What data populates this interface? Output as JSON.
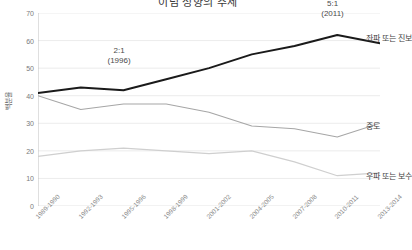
{
  "chart_data": {
    "type": "line",
    "title": "이념 성향의 추세",
    "xlabel": "",
    "ylabel": "백분율",
    "ylim": [
      0,
      70
    ],
    "ytick_step": 10,
    "yticks": [
      "70",
      "60",
      "50",
      "40",
      "30",
      "20",
      "10",
      "0"
    ],
    "grid": true,
    "legend_position": "right-of-line-ends",
    "categories": [
      "1989-1990",
      "1992-1993",
      "1995-1996",
      "1998-1999",
      "2001-2002",
      "2004-2005",
      "2007-2008",
      "2010-2011",
      "2013-2014"
    ],
    "series": [
      {
        "name": "좌파 또는 진보",
        "color": "#1a1a1a",
        "values": [
          41,
          43,
          42,
          46,
          50,
          55,
          58,
          62,
          59
        ]
      },
      {
        "name": "중도",
        "color": "#a6a6a6",
        "values": [
          40,
          35,
          37,
          37,
          34,
          29,
          28,
          25,
          30
        ]
      },
      {
        "name": "우파 또는 보수",
        "color": "#cfcfcf",
        "values": [
          18,
          20,
          21,
          20,
          19,
          20,
          16,
          11,
          12
        ]
      }
    ],
    "annotations": [
      {
        "text": "2:1",
        "sub": "(1996)",
        "x_category": "1995-1996"
      },
      {
        "text": "5:1",
        "sub": "(2011)",
        "x_category": "2010-2011"
      }
    ]
  }
}
